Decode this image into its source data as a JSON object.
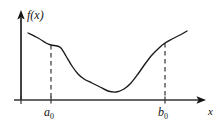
{
  "figure": {
    "kind": "function-graph",
    "background_color": "#ffffff",
    "ink_color": "#141414",
    "curve_color": "#1a1a1a",
    "dash_color": "#333333"
  },
  "labels": {
    "y_axis": "f(x)",
    "x_axis": "x",
    "left_bound_base": "a",
    "left_bound_sub": "0",
    "right_bound_base": "b",
    "right_bound_sub": "0"
  },
  "chart_data": {
    "type": "line",
    "title": "",
    "xlabel": "x",
    "ylabel": "f(x)",
    "grid": false,
    "legend": null,
    "axis_origin_px": {
      "x": 21,
      "y": 100
    },
    "x_axis_end_px": 205,
    "y_axis_top_px": 12,
    "annotations": [
      {
        "name": "a0",
        "label": "a₀",
        "x_px": 51,
        "type": "vertical-dashed-line",
        "from_y_px": 45,
        "to_y_px": 100
      },
      {
        "name": "b0",
        "label": "b₀",
        "x_px": 165,
        "type": "vertical-dashed-line",
        "from_y_px": 43,
        "to_y_px": 100
      }
    ],
    "series": [
      {
        "name": "f(x)",
        "description": "Smooth curve: decreases from upper-left, plateaus near a0, drops steeply, reaches a flat minimum, rises steeply through b0, then flattens at the upper right.",
        "points_px": [
          [
            28,
            33
          ],
          [
            38,
            38
          ],
          [
            46,
            43
          ],
          [
            51,
            45
          ],
          [
            57,
            46
          ],
          [
            61,
            48
          ],
          [
            66,
            56
          ],
          [
            72,
            66
          ],
          [
            78,
            74
          ],
          [
            84,
            79
          ],
          [
            92,
            83
          ],
          [
            100,
            87
          ],
          [
            108,
            91
          ],
          [
            116,
            92
          ],
          [
            124,
            89
          ],
          [
            131,
            83
          ],
          [
            138,
            74
          ],
          [
            145,
            64
          ],
          [
            152,
            55
          ],
          [
            159,
            48
          ],
          [
            165,
            43
          ],
          [
            172,
            39
          ],
          [
            180,
            35
          ],
          [
            187,
            31
          ]
        ]
      }
    ]
  }
}
